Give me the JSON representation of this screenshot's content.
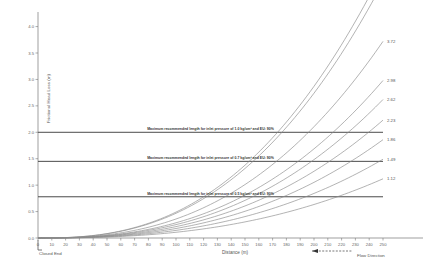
{
  "chart_data": {
    "type": "line",
    "title": "",
    "xlabel": "Distance (m)",
    "ylabel": "Frictional Head Loss (m)",
    "xlim": [
      0,
      250
    ],
    "ylim": [
      0,
      4.2
    ],
    "xticks": [
      0,
      10,
      20,
      30,
      40,
      50,
      60,
      70,
      80,
      90,
      100,
      110,
      120,
      130,
      140,
      150,
      160,
      170,
      180,
      190,
      200,
      210,
      220,
      230,
      240,
      250
    ],
    "yticks": [
      0.0,
      0.5,
      1.0,
      1.5,
      2.0,
      2.5,
      3.0,
      3.5,
      4.0
    ],
    "ytick_labels": [
      "0.0",
      "0.5",
      "1.0",
      "1.5",
      "2.0",
      "2.5",
      "3.0",
      "3.5",
      "4.0"
    ],
    "grid": false,
    "legend": "none",
    "axis_origin_label": "0",
    "series": [
      {
        "name": "curve-1",
        "end_label": "5.07",
        "x": [
          0,
          25,
          50,
          75,
          100,
          125,
          150,
          175,
          200,
          225,
          250
        ],
        "y": [
          0.0,
          0.03,
          0.11,
          0.26,
          0.5,
          0.86,
          1.35,
          2.0,
          2.84,
          3.87,
          5.07
        ]
      },
      {
        "name": "curve-2",
        "end_label": "4.84",
        "x": [
          0,
          25,
          50,
          75,
          100,
          125,
          150,
          175,
          200,
          225,
          250
        ],
        "y": [
          0.0,
          0.02,
          0.08,
          0.19,
          0.37,
          0.65,
          1.04,
          1.58,
          2.32,
          3.35,
          4.84
        ]
      },
      {
        "name": "curve-3",
        "end_label": "3.72",
        "x": [
          0,
          25,
          50,
          75,
          100,
          125,
          150,
          175,
          200,
          225,
          250
        ],
        "y": [
          0.0,
          0.02,
          0.06,
          0.14,
          0.28,
          0.48,
          0.78,
          1.2,
          1.78,
          2.6,
          3.72
        ]
      },
      {
        "name": "curve-4",
        "end_label": "2.98",
        "x": [
          0,
          25,
          50,
          75,
          100,
          125,
          150,
          175,
          200,
          225,
          250
        ],
        "y": [
          0.0,
          0.01,
          0.05,
          0.11,
          0.22,
          0.38,
          0.62,
          0.96,
          1.43,
          2.09,
          2.98
        ]
      },
      {
        "name": "curve-5",
        "end_label": "2.62",
        "x": [
          0,
          25,
          50,
          75,
          100,
          125,
          150,
          175,
          200,
          225,
          250
        ],
        "y": [
          0.0,
          0.01,
          0.04,
          0.1,
          0.19,
          0.33,
          0.54,
          0.84,
          1.26,
          1.84,
          2.62
        ]
      },
      {
        "name": "curve-6",
        "end_label": "2.23",
        "x": [
          0,
          25,
          50,
          75,
          100,
          125,
          150,
          175,
          200,
          225,
          250
        ],
        "y": [
          0.0,
          0.01,
          0.03,
          0.08,
          0.16,
          0.28,
          0.46,
          0.71,
          1.07,
          1.57,
          2.23
        ]
      },
      {
        "name": "curve-7",
        "end_label": "1.86",
        "x": [
          0,
          25,
          50,
          75,
          100,
          125,
          150,
          175,
          200,
          225,
          250
        ],
        "y": [
          0.0,
          0.01,
          0.03,
          0.07,
          0.13,
          0.23,
          0.38,
          0.59,
          0.89,
          1.31,
          1.86
        ]
      },
      {
        "name": "curve-8",
        "end_label": "1.49",
        "x": [
          0,
          25,
          50,
          75,
          100,
          125,
          150,
          175,
          200,
          225,
          250
        ],
        "y": [
          0.0,
          0.01,
          0.02,
          0.06,
          0.11,
          0.19,
          0.31,
          0.48,
          0.72,
          1.05,
          1.49
        ]
      },
      {
        "name": "curve-9",
        "end_label": "1.12",
        "x": [
          0,
          25,
          50,
          75,
          100,
          125,
          150,
          175,
          200,
          225,
          250
        ],
        "y": [
          0.0,
          0.0,
          0.02,
          0.04,
          0.08,
          0.14,
          0.23,
          0.36,
          0.54,
          0.79,
          1.12
        ]
      }
    ],
    "reference_lines": [
      {
        "name": "ref-line-1p0",
        "y": 2.0,
        "label": "Maximum recommended length for inlet pressure of 1.0 kg/cm² and EU: 90%"
      },
      {
        "name": "ref-line-0p7",
        "y": 1.45,
        "label": "Maximum recommended length for inlet pressure of 0.7 kg/cm² and EU: 90%"
      },
      {
        "name": "ref-line-0p5",
        "y": 0.78,
        "label": "Maximum recommended length for inlet pressure of 0.5 kg/cm² and EU: 90%"
      }
    ],
    "annotations": {
      "closed_end": "Closed End",
      "flow_direction": "Flow Direction"
    },
    "colors": {
      "curve": "#8a8a8a",
      "reference_line": "#4a4a4a",
      "axis": "#777777",
      "text": "#555555",
      "background": "#ffffff"
    }
  }
}
